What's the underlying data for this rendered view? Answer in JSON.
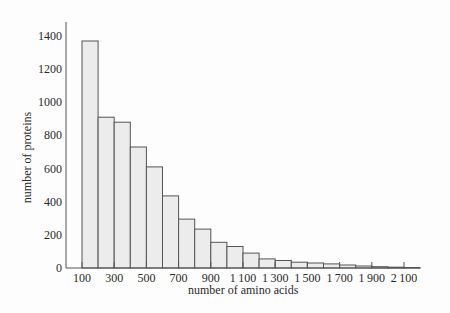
{
  "chart_data": {
    "type": "bar",
    "title": "",
    "xlabel": "number of amino acids",
    "ylabel": "number of proteins",
    "ylim": [
      0,
      1500
    ],
    "yticks": [
      0,
      200,
      400,
      600,
      800,
      1000,
      1200,
      1400
    ],
    "xtick_labels": [
      "100",
      "300",
      "500",
      "700",
      "900",
      "1100",
      "1300",
      "1500",
      "1700",
      "1900",
      "2100"
    ],
    "bin_width": 100,
    "bin_start": 100,
    "categories": [
      "100-200",
      "200-300",
      "300-400",
      "400-500",
      "500-600",
      "600-700",
      "700-800",
      "800-900",
      "900-1000",
      "1000-1100",
      "1100-1200",
      "1200-1300",
      "1300-1400",
      "1400-1500",
      "1500-1600",
      "1600-1700",
      "1700-1800",
      "1800-1900",
      "1900-2000",
      "2000-2100",
      "2100-2200"
    ],
    "values": [
      1370,
      910,
      880,
      730,
      610,
      435,
      295,
      235,
      155,
      130,
      90,
      55,
      45,
      35,
      30,
      25,
      18,
      12,
      8,
      5,
      3
    ],
    "grid": false,
    "legend": null,
    "bar_fill": "#ececec",
    "bar_stroke": "#555555"
  }
}
